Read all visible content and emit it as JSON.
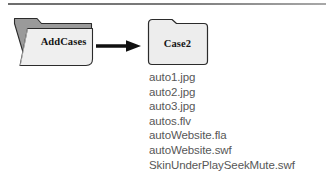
{
  "figure": {
    "type": "folder-copy-diagram",
    "rule_color": "#6d6d6d"
  },
  "source_folder": {
    "name": "folder-icon-addcases",
    "label": "AddCases",
    "back_color": "#9a9a9a",
    "front_color": "#ececec",
    "outline_color": "#2b2b2b"
  },
  "arrow": {
    "name": "arrow-right",
    "color": "#101010",
    "direction": "right"
  },
  "destination_folder": {
    "name": "folder-icon-case2",
    "label": "Case2",
    "fill_color": "#ededed",
    "outline_color": "#2b2b2b"
  },
  "file_list": {
    "text_color": "#575757",
    "items": [
      "auto1.jpg",
      "auto2.jpg",
      "auto3.jpg",
      "autos.flv",
      "autoWebsite.fla",
      "autoWebsite.swf",
      "SkinUnderPlaySeekMute.swf"
    ]
  }
}
